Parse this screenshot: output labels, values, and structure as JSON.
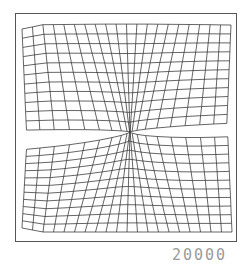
{
  "figure": {
    "label": "20000",
    "frame_color": "#555555",
    "line_color": "#222222",
    "label_color": "#9a9a9a"
  },
  "mesh": {
    "columns": 20,
    "rows_per_half": 11,
    "singularity": {
      "x": 130,
      "y": 132
    },
    "upper": {
      "top": 25,
      "left": 22,
      "right": 231,
      "bottom_left": 130,
      "bottom_right": 123
    },
    "lower": {
      "bottom": 232,
      "left": 22,
      "right": 232,
      "top_left": 150,
      "top_right": 137
    }
  }
}
